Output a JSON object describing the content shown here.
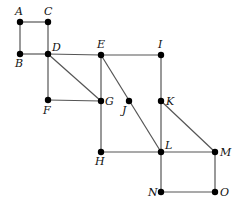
{
  "graph": {
    "nodes": [
      {
        "id": "A",
        "x": 20,
        "y": 22,
        "lx": 15,
        "ly": 15
      },
      {
        "id": "C",
        "x": 48,
        "y": 22,
        "lx": 44,
        "ly": 15
      },
      {
        "id": "B",
        "x": 20,
        "y": 54,
        "lx": 15,
        "ly": 67
      },
      {
        "id": "D",
        "x": 48,
        "y": 54,
        "lx": 52,
        "ly": 51
      },
      {
        "id": "E",
        "x": 101,
        "y": 55,
        "lx": 97,
        "ly": 48
      },
      {
        "id": "I",
        "x": 161,
        "y": 55,
        "lx": 158,
        "ly": 48
      },
      {
        "id": "F",
        "x": 48,
        "y": 100,
        "lx": 43,
        "ly": 114
      },
      {
        "id": "G",
        "x": 101,
        "y": 101,
        "lx": 105,
        "ly": 105
      },
      {
        "id": "J",
        "x": 129,
        "y": 101,
        "lx": 122,
        "ly": 114
      },
      {
        "id": "K",
        "x": 161,
        "y": 101,
        "lx": 166,
        "ly": 105
      },
      {
        "id": "H",
        "x": 101,
        "y": 152,
        "lx": 95,
        "ly": 165
      },
      {
        "id": "L",
        "x": 161,
        "y": 152,
        "lx": 165,
        "ly": 149
      },
      {
        "id": "M",
        "x": 215,
        "y": 152,
        "lx": 220,
        "ly": 156
      },
      {
        "id": "N",
        "x": 161,
        "y": 192,
        "lx": 148,
        "ly": 196
      },
      {
        "id": "O",
        "x": 215,
        "y": 192,
        "lx": 220,
        "ly": 196
      }
    ],
    "edges": [
      [
        "A",
        "C"
      ],
      [
        "A",
        "B"
      ],
      [
        "C",
        "D"
      ],
      [
        "B",
        "D"
      ],
      [
        "D",
        "E"
      ],
      [
        "E",
        "I"
      ],
      [
        "D",
        "F"
      ],
      [
        "D",
        "G"
      ],
      [
        "F",
        "G"
      ],
      [
        "E",
        "G"
      ],
      [
        "E",
        "L"
      ],
      [
        "G",
        "H"
      ],
      [
        "H",
        "L"
      ],
      [
        "I",
        "K"
      ],
      [
        "K",
        "L"
      ],
      [
        "K",
        "M"
      ],
      [
        "L",
        "M"
      ],
      [
        "L",
        "N"
      ],
      [
        "M",
        "O"
      ],
      [
        "N",
        "O"
      ]
    ]
  }
}
